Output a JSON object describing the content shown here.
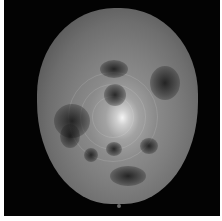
{
  "image": {
    "description": "grayscale image of a roughly spherical textured object on black background",
    "colors": {
      "background": "#030303",
      "border": "#ffffff",
      "highlight": "#f4f4f4",
      "body_mid": "#7d7d7d"
    },
    "features": {
      "bright_center": "concentric ring pattern near center",
      "dark_spots": [
        "upper-right",
        "upper-center",
        "left",
        "lower-left",
        "lower-center",
        "lower-right",
        "bottom"
      ]
    }
  }
}
